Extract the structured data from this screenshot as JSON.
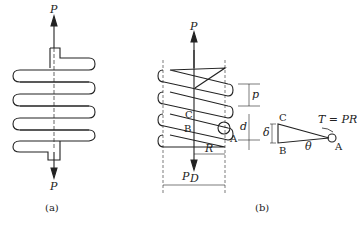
{
  "figure_a": {
    "caption": "(a)",
    "labels": {
      "top_force": "P",
      "bottom_force": "P"
    }
  },
  "figure_b": {
    "caption": "(b)",
    "labels": {
      "top_force": "P",
      "bottom_force": "P",
      "pitch": "p",
      "wire_diameter": "d",
      "radius": "R",
      "diameter": "D",
      "point_a": "A",
      "point_b": "B",
      "point_c": "C"
    }
  },
  "detail": {
    "point_c": "C",
    "point_b": "B",
    "point_a": "A",
    "delta": "δ",
    "theta": "θ",
    "torque": "T = PR"
  }
}
